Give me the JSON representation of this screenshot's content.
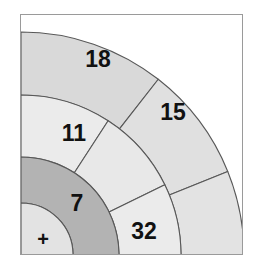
{
  "figure": {
    "frame": {
      "border_color": "#9a9a9a",
      "background": "#ffffff"
    },
    "colors": {
      "light": "#e8e8e8",
      "mid": "#d9d9d9",
      "dark": "#b3b3b3",
      "lightest": "#e3e3e3",
      "stroke": "#585858"
    },
    "geometry": {
      "center_x": 0,
      "center_y": 240,
      "radii": [
        0,
        52,
        98,
        160,
        223
      ],
      "angle_span_deg": 90
    }
  },
  "chart_data": {
    "type": "pie",
    "title": "",
    "xlabel": "",
    "ylabel": "",
    "legend": "none",
    "grid": false,
    "sectors": [
      {
        "label": "18",
        "value": 18,
        "ring": 3,
        "r_inner": 160,
        "r_outer": 223,
        "a_start": 52,
        "a_end": 90,
        "fill": "#d9d9d9",
        "label_x": 77,
        "label_y": 46
      },
      {
        "label": "15",
        "value": 15,
        "ring": 3,
        "r_inner": 160,
        "r_outer": 223,
        "a_start": 22,
        "a_end": 52,
        "fill": "#e0e0e0",
        "label_x": 152,
        "label_y": 99
      },
      {
        "label": "",
        "value": null,
        "ring": 3,
        "r_inner": 160,
        "r_outer": 223,
        "a_start": 0,
        "a_end": 22,
        "fill": "#e3e3e3",
        "label_x": 190,
        "label_y": 200
      },
      {
        "label": "11",
        "value": 11,
        "ring": 2,
        "r_inner": 98,
        "r_outer": 160,
        "a_start": 57,
        "a_end": 90,
        "fill": "#ebebeb",
        "label_x": 53,
        "label_y": 120
      },
      {
        "label": "",
        "value": null,
        "ring": 2,
        "r_inner": 98,
        "r_outer": 160,
        "a_start": 26,
        "a_end": 57,
        "fill": "#e8e8e8",
        "label_x": 105,
        "label_y": 155
      },
      {
        "label": "32",
        "value": 32,
        "ring": 2,
        "r_inner": 98,
        "r_outer": 160,
        "a_start": 0,
        "a_end": 26,
        "fill": "#ebebeb",
        "label_x": 123,
        "label_y": 218
      },
      {
        "label": "7",
        "value": 7,
        "ring": 1,
        "r_inner": 52,
        "r_outer": 98,
        "a_start": 0,
        "a_end": 90,
        "fill": "#b3b3b3",
        "label_x": 56,
        "label_y": 190
      },
      {
        "label": "+",
        "value": null,
        "ring": 0,
        "r_inner": 0,
        "r_outer": 52,
        "a_start": 0,
        "a_end": 90,
        "fill": "#e3e3e3",
        "label_x": 22,
        "label_y": 226
      }
    ]
  }
}
